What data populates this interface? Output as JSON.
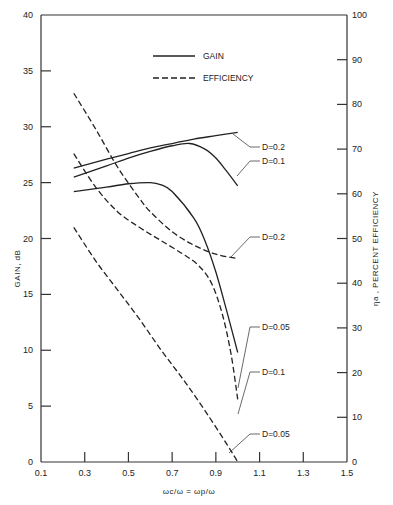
{
  "chart_data": {
    "type": "line",
    "title": "",
    "xlabel": "ωc/ω = ωp/ω",
    "ylabel": "GAIN, dB",
    "y2label": "ηa , PERCENT EFFICIENCY",
    "xlim": [
      0.1,
      1.5
    ],
    "ylim": [
      0,
      40
    ],
    "y2lim": [
      0,
      100
    ],
    "grid": false,
    "legend_position": "upper-center",
    "legend": [
      {
        "label": "GAIN",
        "style": "solid"
      },
      {
        "label": "EFFICIENCY",
        "style": "dashed"
      }
    ],
    "x_ticks": [
      "0.1",
      "0.3",
      "0.5",
      "0.7",
      "0.9",
      "1.1",
      "1.3",
      "1.5"
    ],
    "x_tick_values": [
      0.1,
      0.3,
      0.5,
      0.7,
      0.9,
      1.1,
      1.3,
      1.5
    ],
    "y_ticks": [
      "0",
      "5",
      "10",
      "15",
      "20",
      "25",
      "30",
      "35",
      "40"
    ],
    "y_tick_values": [
      0,
      5,
      10,
      15,
      20,
      25,
      30,
      35,
      40
    ],
    "y2_ticks": [
      "0",
      "10",
      "20",
      "30",
      "40",
      "50",
      "60",
      "70",
      "80",
      "90",
      "100"
    ],
    "y2_tick_values": [
      0,
      10,
      20,
      30,
      40,
      50,
      60,
      70,
      80,
      90,
      100
    ],
    "series": [
      {
        "name": "Gain D=0.2",
        "axis": "left",
        "style": "solid",
        "x": [
          0.25,
          0.4,
          0.5,
          0.6,
          0.7,
          0.8,
          0.9,
          1.0
        ],
        "values": [
          26.3,
          27.1,
          27.6,
          28.1,
          28.5,
          28.9,
          29.2,
          29.5
        ]
      },
      {
        "name": "Gain D=0.1",
        "axis": "left",
        "style": "solid",
        "x": [
          0.25,
          0.4,
          0.5,
          0.6,
          0.7,
          0.78,
          0.85,
          0.9,
          0.95,
          1.0
        ],
        "values": [
          25.5,
          26.5,
          27.2,
          27.8,
          28.3,
          28.5,
          28.0,
          27.2,
          26.0,
          24.7
        ]
      },
      {
        "name": "Gain D=0.05",
        "axis": "left",
        "style": "solid",
        "x": [
          0.25,
          0.4,
          0.5,
          0.6,
          0.65,
          0.7,
          0.8,
          0.85,
          0.9,
          0.95,
          1.0
        ],
        "values": [
          24.2,
          24.6,
          24.9,
          25.0,
          24.8,
          24.2,
          21.8,
          19.8,
          17.0,
          13.5,
          9.8
        ]
      },
      {
        "name": "Efficiency D=0.2",
        "axis": "right",
        "style": "dashed",
        "x": [
          0.25,
          0.35,
          0.45,
          0.55,
          0.6,
          0.7,
          0.8,
          0.9,
          1.0
        ],
        "values": [
          82.5,
          74.5,
          66.0,
          59.0,
          56.0,
          51.5,
          48.5,
          46.5,
          45.5
        ]
      },
      {
        "name": "Efficiency D=0.1",
        "axis": "right",
        "style": "dashed",
        "x": [
          0.25,
          0.35,
          0.45,
          0.55,
          0.65,
          0.75,
          0.82,
          0.88,
          0.93,
          0.97,
          1.0
        ],
        "values": [
          69.0,
          61.5,
          56.0,
          52.5,
          49.5,
          46.5,
          44.0,
          40.0,
          33.0,
          24.0,
          14.0
        ]
      },
      {
        "name": "Efficiency D=0.05",
        "axis": "right",
        "style": "dashed",
        "x": [
          0.25,
          0.35,
          0.45,
          0.55,
          0.65,
          0.75,
          0.85,
          0.95,
          1.0
        ],
        "values": [
          52.5,
          45.0,
          38.5,
          32.0,
          25.0,
          18.5,
          11.5,
          4.0,
          0.0
        ]
      }
    ],
    "annotations": [
      {
        "text": "D=0.2",
        "points_to": "Gain D=0.2"
      },
      {
        "text": "D=0.1",
        "points_to": "Gain D=0.1"
      },
      {
        "text": "D=0.2",
        "points_to": "Efficiency D=0.2"
      },
      {
        "text": "D=0.05",
        "points_to": "Gain D=0.05"
      },
      {
        "text": "D=0.1",
        "points_to": "Efficiency D=0.1"
      },
      {
        "text": "D=0.05",
        "points_to": "Efficiency D=0.05"
      }
    ]
  },
  "labels": {
    "legend_gain": "GAIN",
    "legend_eff": "EFFICIENCY",
    "xlabel": "ωc/ω = ωp/ω",
    "ylabel": "GAIN, dB",
    "y2label": "ηa , PERCENT EFFICIENCY"
  }
}
